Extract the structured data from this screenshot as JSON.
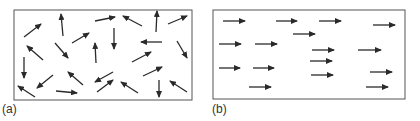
{
  "figure": {
    "panels": [
      {
        "label": "(a)",
        "description": "random orientation",
        "box": {
          "x": 14,
          "y": 10,
          "w": 178,
          "h": 90
        },
        "arrows": [
          [
            24,
            37,
            41,
            24
          ],
          [
            63,
            36,
            61,
            14
          ],
          [
            95,
            21,
            115,
            17
          ],
          [
            142,
            26,
            123,
            16
          ],
          [
            156,
            32,
            157,
            11
          ],
          [
            168,
            24,
            187,
            16
          ],
          [
            72,
            43,
            89,
            33
          ],
          [
            114,
            28,
            114,
            49
          ],
          [
            43,
            60,
            27,
            46
          ],
          [
            55,
            43,
            68,
            58
          ],
          [
            96,
            63,
            95,
            43
          ],
          [
            162,
            42,
            141,
            42
          ],
          [
            177,
            41,
            187,
            58
          ],
          [
            132,
            62,
            151,
            52
          ],
          [
            24,
            57,
            24,
            78
          ],
          [
            53,
            75,
            37,
            88
          ],
          [
            83,
            85,
            68,
            72
          ],
          [
            113,
            72,
            95,
            82
          ],
          [
            143,
            76,
            162,
            67
          ],
          [
            35,
            97,
            18,
            86
          ],
          [
            56,
            91,
            77,
            93
          ],
          [
            97,
            92,
            113,
            80
          ],
          [
            138,
            93,
            121,
            82
          ],
          [
            159,
            80,
            159,
            97
          ],
          [
            187,
            92,
            170,
            81
          ]
        ]
      },
      {
        "label": "(b)",
        "description": "aligned orientation",
        "box": {
          "x": 213,
          "y": 10,
          "w": 192,
          "h": 89
        },
        "arrows": [
          [
            223,
            21,
            245,
            21
          ],
          [
            276,
            21,
            297,
            21
          ],
          [
            319,
            21,
            341,
            21
          ],
          [
            373,
            25,
            395,
            25
          ],
          [
            293,
            34,
            315,
            34
          ],
          [
            219,
            44,
            241,
            44
          ],
          [
            255,
            44,
            277,
            44
          ],
          [
            312,
            50,
            334,
            50
          ],
          [
            358,
            50,
            381,
            50
          ],
          [
            310,
            61,
            332,
            61
          ],
          [
            219,
            68,
            240,
            68
          ],
          [
            253,
            68,
            274,
            68
          ],
          [
            311,
            75,
            333,
            75
          ],
          [
            370,
            72,
            392,
            72
          ],
          [
            249,
            87,
            271,
            87
          ],
          [
            366,
            87,
            388,
            87
          ]
        ]
      }
    ],
    "colors": {
      "arrow": "#2a2a2a",
      "box": "#555555",
      "label": "#333333"
    }
  }
}
